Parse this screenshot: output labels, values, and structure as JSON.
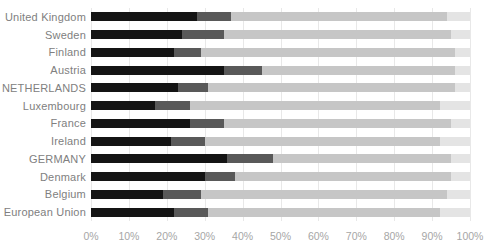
{
  "chart_data": {
    "type": "bar",
    "orientation": "horizontal",
    "stacked": true,
    "title": "",
    "xlabel": "",
    "ylabel": "",
    "xlim": [
      0,
      100
    ],
    "grid": "vertical-light-gray",
    "legend": "none",
    "x_ticks": [
      "0%",
      "10%",
      "20%",
      "30%",
      "40%",
      "50%",
      "60%",
      "70%",
      "80%",
      "90%",
      "100%"
    ],
    "categories": [
      "United Kingdom",
      "Sweden",
      "Finland",
      "Austria",
      "NETHERLANDS",
      "Luxembourg",
      "France",
      "Ireland",
      "GERMANY",
      "Denmark",
      "Belgium",
      "European Union"
    ],
    "series": [
      {
        "name": "segment-black",
        "color": "#141414",
        "values": [
          28,
          24,
          22,
          35,
          23,
          17,
          26,
          21,
          36,
          30,
          19,
          22
        ]
      },
      {
        "name": "segment-dark-gray",
        "color": "#595959",
        "values": [
          9,
          11,
          7,
          10,
          8,
          9,
          9,
          9,
          12,
          8,
          10,
          9
        ]
      },
      {
        "name": "segment-light-gray",
        "color": "#c6c6c6",
        "values": [
          57,
          60,
          67,
          51,
          65,
          66,
          60,
          62,
          47,
          57,
          65,
          61
        ]
      },
      {
        "name": "segment-lighter-gray",
        "color": "#e4e4e4",
        "values": [
          6,
          5,
          4,
          4,
          4,
          8,
          5,
          8,
          5,
          5,
          6,
          8
        ]
      }
    ],
    "colors": {
      "category_label": "#808080",
      "axis_label": "#a6a6a6",
      "gridline": "#e8e8e8",
      "background": "#ffffff"
    }
  }
}
